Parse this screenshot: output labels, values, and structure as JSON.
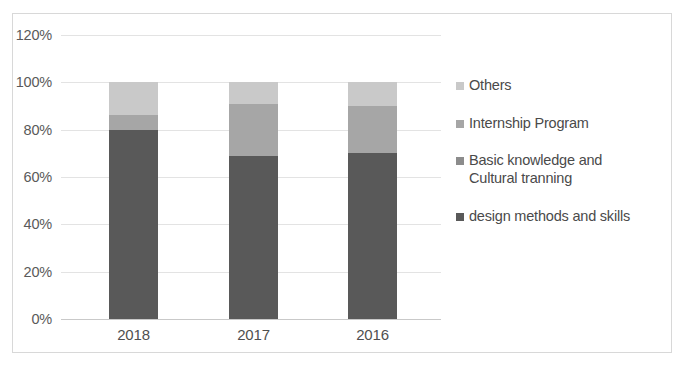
{
  "chart_data": {
    "type": "bar",
    "subtype": "stacked-percent",
    "title": "",
    "xlabel": "",
    "ylabel": "",
    "categories": [
      "2018",
      "2017",
      "2016"
    ],
    "ylim": [
      0,
      120
    ],
    "yticks": [
      "0%",
      "20%",
      "40%",
      "60%",
      "80%",
      "100%",
      "120%"
    ],
    "ytick_values": [
      0,
      20,
      40,
      60,
      80,
      100,
      120
    ],
    "grid": true,
    "legend_position": "right",
    "series": [
      {
        "name": "design methods and skills",
        "color": "#595959",
        "values": [
          80,
          69,
          70
        ]
      },
      {
        "name": "Basic knowledge and\nCultural tranning",
        "color": "#8c8c8c",
        "values": [
          6,
          22,
          20
        ]
      },
      {
        "name": "Internship Program",
        "color": "#a6a6a6",
        "values": [
          0,
          0,
          0
        ]
      },
      {
        "name": "Others",
        "color": "#c9c9c9",
        "values": [
          14,
          9,
          10
        ]
      }
    ],
    "stacks": [
      {
        "category": "2018",
        "segments": [
          {
            "name": "Others",
            "value": 14,
            "color": "#c9c9c9"
          },
          {
            "name": "Internship Program",
            "value": 6,
            "color": "#a6a6a6"
          },
          {
            "name": "design methods and skills",
            "value": 80,
            "color": "#595959"
          }
        ]
      },
      {
        "category": "2017",
        "segments": [
          {
            "name": "Others",
            "value": 9,
            "color": "#c9c9c9"
          },
          {
            "name": "Internship Program",
            "value": 22,
            "color": "#a6a6a6"
          },
          {
            "name": "design methods and skills",
            "value": 69,
            "color": "#595959"
          }
        ]
      },
      {
        "category": "2016",
        "segments": [
          {
            "name": "Others",
            "value": 10,
            "color": "#c9c9c9"
          },
          {
            "name": "Internship Program",
            "value": 20,
            "color": "#a6a6a6"
          },
          {
            "name": "design methods and skills",
            "value": 70,
            "color": "#595959"
          }
        ]
      }
    ],
    "legend": [
      {
        "label": "Others",
        "color": "#c9c9c9"
      },
      {
        "label": "Internship Program",
        "color": "#a6a6a6"
      },
      {
        "label": "Basic knowledge and\nCultural tranning",
        "color": "#8c8c8c"
      },
      {
        "label": "design methods and skills",
        "color": "#595959"
      }
    ]
  },
  "colors": {
    "plot_background": "#ffffff",
    "frame_border": "#d8d8d8",
    "gridline": "#e3e3e3",
    "axis": "#c9c9c9",
    "tick_text": "#5a5a5a"
  }
}
